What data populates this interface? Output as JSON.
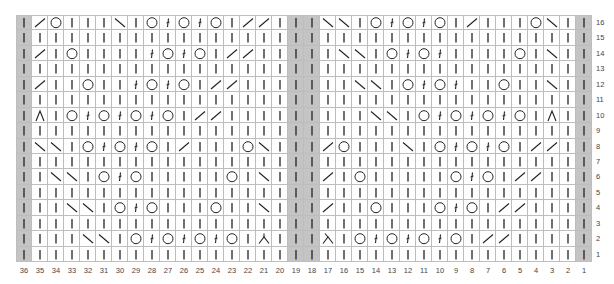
{
  "chart_title": "",
  "legend": {
    "K": "knit (vertical bar)",
    "L": "right-leaning decrease (/)",
    "R": "left-leaning decrease (\\)",
    "O": "yarn over (circle)",
    "T": "twisted stitch",
    "A": "centered double decrease (Λ)",
    "B": "double decrease variant with left tail",
    "C": "double decrease variant with right tail"
  },
  "gray_columns": [
    36,
    19,
    18,
    1
  ],
  "colors": {
    "grid": "#bdbdbd",
    "gray": "#c4c4c4",
    "symbol": "#222222",
    "label": "#444444"
  },
  "column_numbers": [
    "36",
    "35",
    "34",
    "33",
    "32",
    "31",
    "30",
    "29",
    "28",
    "27",
    "26",
    "25",
    "24",
    "23",
    "22",
    "21",
    "20",
    "19",
    "18",
    "17",
    "16",
    "15",
    "14",
    "13",
    "12",
    "11",
    "10",
    "9",
    "8",
    "7",
    "6",
    "5",
    "4",
    "3",
    "2",
    "1"
  ],
  "row_numbers": [
    "16",
    "15",
    "14",
    "13",
    "12",
    "11",
    "10",
    "9",
    "8",
    "7",
    "6",
    "5",
    "4",
    "3",
    "2",
    "1"
  ],
  "chart_data": {
    "type": "table",
    "columns_left_to_right": "36..1",
    "rows_top_to_bottom": "16..1",
    "rows": {
      "16": "KLOKKKRKOTOTOKLLKKKRRKOTOTOKLKKKORKK",
      "15": "KKKKKKKKKKKKKKKKKKKKKKKKKKKKKKKKKKKK",
      "14": "KLKOKKKKTOTOKLLKKKKKRRKOTOTKKKKOKRKK",
      "13": "KKKKKKKKKKKKKKKKKKKKKKKKKKKKKKKKKKKK",
      "12": "KLKKOKKTOTOKLLKKKKKKKRRKOTOTKKOKKRKK",
      "11": "KKKKKKKKKKKKKKKKKKKKKKKKKKKKKKKKKKKK",
      "10": "KAKOTOTOTOKLLKKKKKKKKKRRKOTOTOTOKAKK",
      "9": "KKKKKKKKKKKKKKKKKKKKKKKKKKKKKKKKKKKK",
      "8": "KRRKOTOTOKLKKKORKKKLOKKKRKOTOTOKLLKK",
      "7": "KKKKKKKKKKKKKKKKKKKKKKKKKKKKKKKKKKKK",
      "6": "KKRRKOTOKKKKKOKRKKKLKOKKKKKOTOKLLKKK",
      "5": "KKKKKKKKKKKKKKKKKKKKKKKKKKKKKKKKKKKK",
      "4": "KKKRRKOTOKKKOKKRKKKLKKOKKKOTOKLLKKKK",
      "3": "KKKKKKKKKKKKKKKKKKKKKKKKKKKKKKKKKKKK",
      "2": "KKKKRRKOTOTOTOKBKKKCKOTOTOTOKLLKKKKK",
      "1": "KKKKKKKKKKKKKKKKKKKKKKKKKKKKKKKKKKKK"
    }
  }
}
